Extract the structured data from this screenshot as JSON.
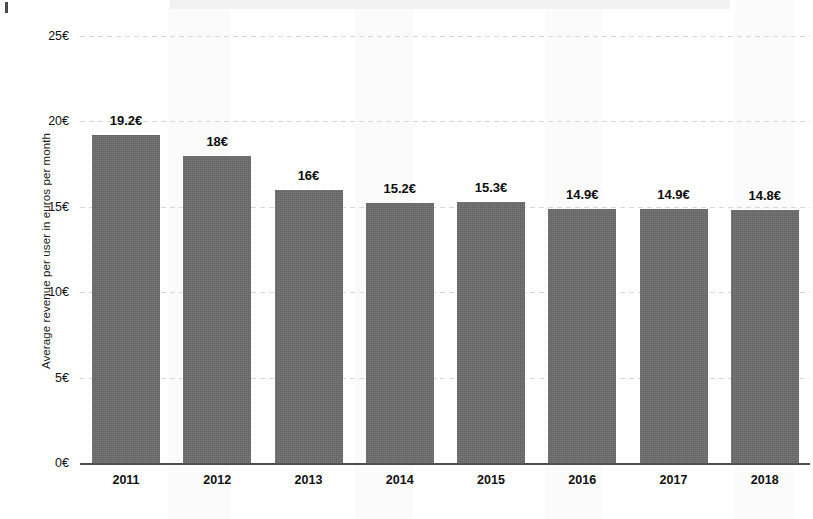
{
  "chart_data": {
    "type": "bar",
    "title": "",
    "xlabel": "",
    "ylabel": "Average revenue per user in euros per month",
    "categories": [
      "2011",
      "2012",
      "2013",
      "2014",
      "2015",
      "2016",
      "2017",
      "2018"
    ],
    "values": [
      19.2,
      18,
      16,
      15.2,
      15.3,
      14.9,
      14.9,
      14.8
    ],
    "value_labels": [
      "19.2€",
      "18€",
      "16€",
      "15.2€",
      "15.3€",
      "14.9€",
      "14.9€",
      "14.8€"
    ],
    "ylim": [
      0,
      25
    ],
    "ytick_values": [
      0,
      5,
      10,
      15,
      20,
      25
    ],
    "ytick_labels": [
      "0€",
      "5€",
      "10€",
      "15€",
      "20€",
      "25€"
    ],
    "grid": true,
    "legend": null,
    "bar_color": "#6c6c6c",
    "currency": "€"
  }
}
